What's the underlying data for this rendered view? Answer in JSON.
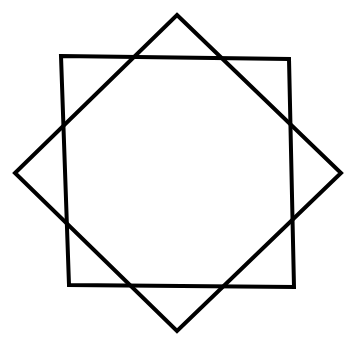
{
  "figure": {
    "background": "#ffffff",
    "stroke_color": "#000000",
    "stroke_width": 4,
    "shapes": [
      {
        "id": "square",
        "type": "polygon",
        "points": [
          [
            61,
            56
          ],
          [
            289,
            59
          ],
          [
            294,
            287
          ],
          [
            69,
            285
          ]
        ]
      },
      {
        "id": "diamond",
        "type": "polygon",
        "points": [
          [
            177,
            15
          ],
          [
            341,
            173
          ],
          [
            177,
            331
          ],
          [
            15,
            173
          ]
        ]
      }
    ]
  }
}
